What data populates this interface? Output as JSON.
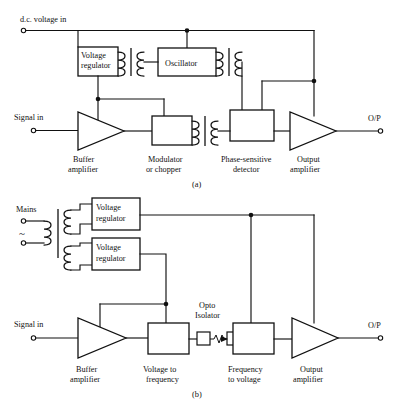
{
  "figure": {
    "ink_color": "#111111",
    "background_color": "#ffffff",
    "footer_caption": ""
  },
  "diagram_a": {
    "caption": "(a)",
    "inputs": {
      "dc_supply": "d.c. voltage in",
      "signal": "Signal in"
    },
    "output": "O/P",
    "blocks": [
      {
        "id": "voltage-regulator",
        "line1": "Voltage",
        "line2": "regulator"
      },
      {
        "id": "oscillator",
        "line1": "Oscillator",
        "line2": ""
      }
    ],
    "labels": [
      {
        "id": "buffer-amplifier",
        "line1": "Buffer",
        "line2": "amplifier"
      },
      {
        "id": "modulator-chopper",
        "line1": "Modulator",
        "line2": "or chopper"
      },
      {
        "id": "phase-sensitive-detector",
        "line1": "Phase-sensitive",
        "line2": "detector"
      },
      {
        "id": "output-amplifier",
        "line1": "Output",
        "line2": "amplifier"
      }
    ]
  },
  "diagram_b": {
    "caption": "(b)",
    "inputs": {
      "mains": "Mains",
      "ac_symbol": "~",
      "signal": "Signal in"
    },
    "output": "O/P",
    "blocks": [
      {
        "id": "voltage-regulator-top",
        "line1": "Voltage",
        "line2": "regulator"
      },
      {
        "id": "voltage-regulator-bottom",
        "line1": "Voltage",
        "line2": "regulator"
      }
    ],
    "opto_isolator": {
      "line1": "Opto",
      "line2": "Isolator"
    },
    "labels": [
      {
        "id": "buffer-amplifier",
        "line1": "Buffer",
        "line2": "amplifier"
      },
      {
        "id": "voltage-to-frequency",
        "line1": "Voltage to",
        "line2": "frequency"
      },
      {
        "id": "frequency-to-voltage",
        "line1": "Frequency",
        "line2": "to voltage"
      },
      {
        "id": "output-amplifier",
        "line1": "Output",
        "line2": "amplifier"
      }
    ]
  }
}
